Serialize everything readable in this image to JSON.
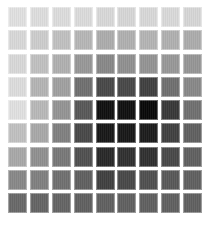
{
  "grid": {
    "rows": 9,
    "columns": 9,
    "cells": [
      [
        "#e0e0e0",
        "#dddddd",
        "#dcdcdc",
        "#dbdbdb",
        "#d8d8d8",
        "#d6d6d6",
        "#d8d8d8",
        "#d9d9d9",
        "#d6d6d6"
      ],
      [
        "#d8d8d8",
        "#cccccc",
        "#c0c0c0",
        "#b6b6b6",
        "#acacac",
        "#b0b0b0",
        "#b4b4b4",
        "#b0b0b0",
        "#acacac"
      ],
      [
        "#d8d8d8",
        "#c0c0c0",
        "#b0b0b0",
        "#989898",
        "#888888",
        "#909090",
        "#949494",
        "#989898",
        "#969696"
      ],
      [
        "#dcdcdc",
        "#b4b4b4",
        "#a0a0a0",
        "#707070",
        "#484848",
        "#484848",
        "#404040",
        "#707070",
        "#888888"
      ],
      [
        "#e0e0e0",
        "#b8b8b8",
        "#949494",
        "#585858",
        "#101010",
        "#101010",
        "#080808",
        "#383838",
        "#707070"
      ],
      [
        "#c0c0c0",
        "#a8a8a8",
        "#808080",
        "#484848",
        "#181818",
        "#181818",
        "#1c1c1c",
        "#404040",
        "#606060"
      ],
      [
        "#a8a8a8",
        "#909090",
        "#787878",
        "#505050",
        "#282828",
        "#303030",
        "#303030",
        "#484848",
        "#606060"
      ],
      [
        "#888888",
        "#808080",
        "#707070",
        "#606060",
        "#404040",
        "#484848",
        "#505050",
        "#585858",
        "#606060"
      ],
      [
        "#686868",
        "#646464",
        "#646464",
        "#606060",
        "#606060",
        "#606060",
        "#606060",
        "#606060",
        "#606060"
      ]
    ]
  }
}
